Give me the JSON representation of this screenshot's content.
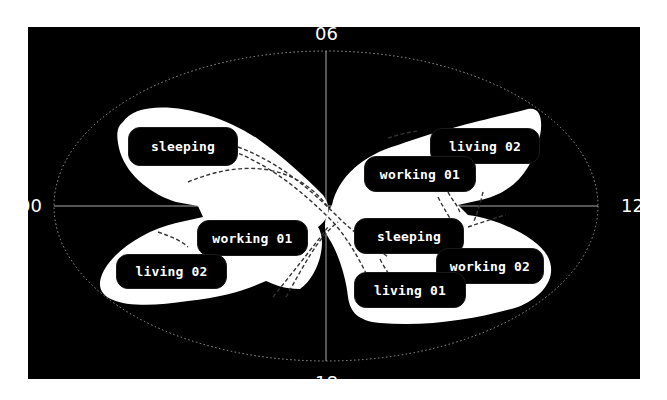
{
  "diagram": {
    "type": "polar-clock-diagram",
    "colors": {
      "background": "#000000",
      "shape_fill": "#ffffff",
      "label_bg": "#000000",
      "label_text": "#ffffff",
      "axis": "#bbbbbb"
    },
    "axis_labels": {
      "top": "06",
      "left": "00",
      "right": "12",
      "bottom": "18"
    },
    "nodes": [
      {
        "id": "sleeping-left",
        "label": "sleeping",
        "x": 100,
        "y": 100,
        "w": 110,
        "h": 39
      },
      {
        "id": "working01-left",
        "label": "working 01",
        "x": 169,
        "y": 193,
        "w": 111,
        "h": 36
      },
      {
        "id": "living02-left",
        "label": "living 02",
        "x": 88,
        "y": 227,
        "w": 111,
        "h": 35
      },
      {
        "id": "living02-right",
        "label": "living 02",
        "x": 402,
        "y": 101,
        "w": 110,
        "h": 36
      },
      {
        "id": "working01-right",
        "label": "working 01",
        "x": 336,
        "y": 129,
        "w": 112,
        "h": 36
      },
      {
        "id": "sleeping-right",
        "label": "sleeping",
        "x": 326,
        "y": 191,
        "w": 110,
        "h": 36
      },
      {
        "id": "working02-right",
        "label": "working 02",
        "x": 408,
        "y": 221,
        "w": 108,
        "h": 36
      },
      {
        "id": "living01-right",
        "label": "living 01",
        "x": 326,
        "y": 245,
        "w": 112,
        "h": 36
      }
    ]
  }
}
